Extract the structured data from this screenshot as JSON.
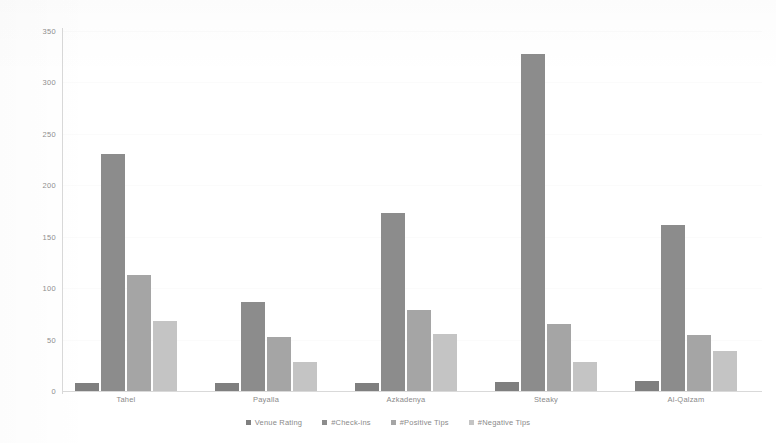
{
  "chart_data": {
    "type": "bar",
    "title": "",
    "xlabel": "",
    "ylabel": "",
    "ylim": [
      0,
      350
    ],
    "yticks": [
      0,
      50,
      100,
      150,
      200,
      250,
      300,
      350
    ],
    "grid": false,
    "legend_position": "bottom",
    "categories": [
      "Tahel",
      "Payalla",
      "Azkadenya",
      "Steaky",
      "Al-Qalzam"
    ],
    "series": [
      {
        "name": "Venue Rating",
        "color": "#7f7f7f",
        "values": [
          8,
          8,
          8,
          9,
          10
        ]
      },
      {
        "name": "#Check-ins",
        "color": "#8c8c8c",
        "values": [
          230,
          87,
          173,
          328,
          161
        ]
      },
      {
        "name": "#Positive Tips",
        "color": "#a5a5a5",
        "values": [
          113,
          53,
          79,
          65,
          54
        ]
      },
      {
        "name": "#Negative Tips",
        "color": "#c4c4c4",
        "values": [
          68,
          28,
          55,
          28,
          39
        ]
      }
    ]
  },
  "axis": {
    "tick_labels": [
      "350",
      "300",
      "250",
      "200",
      "150",
      "100",
      "50",
      "0"
    ]
  }
}
